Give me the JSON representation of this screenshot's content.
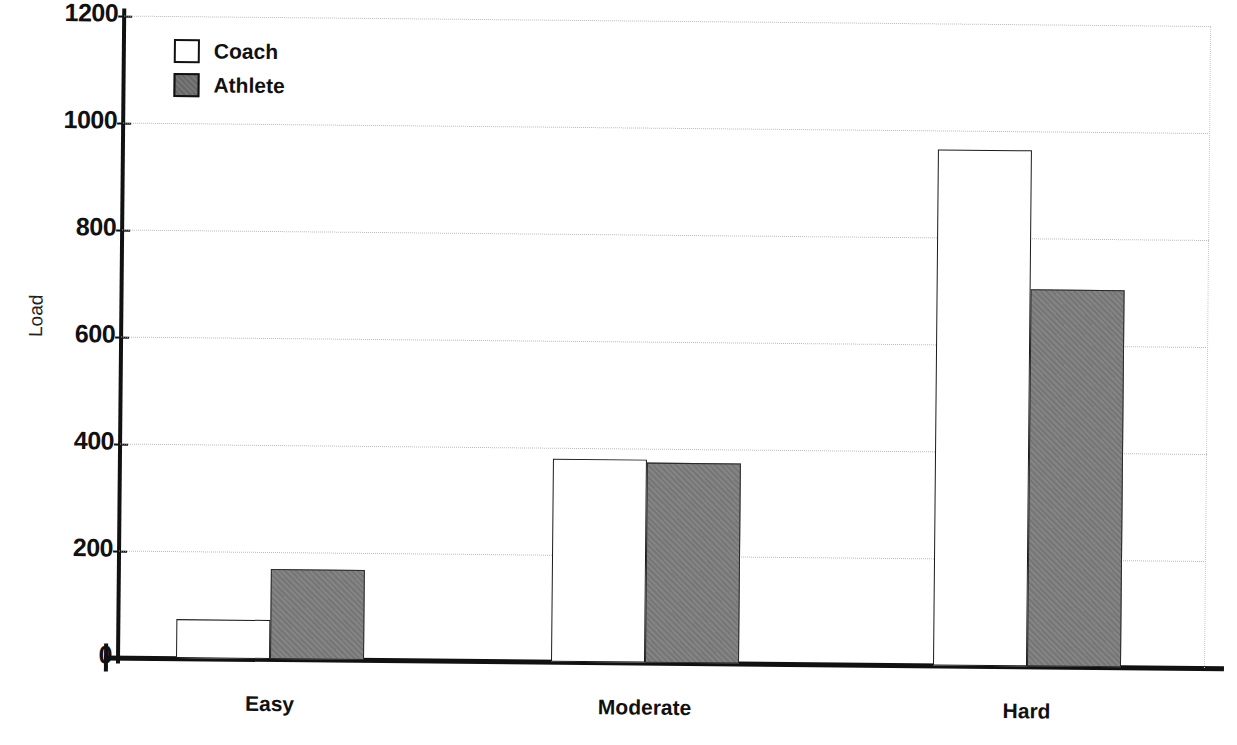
{
  "chart_data": {
    "type": "bar",
    "title": "",
    "xlabel": "",
    "ylabel": "Load",
    "categories": [
      "Easy",
      "Moderate",
      "Hard"
    ],
    "series": [
      {
        "name": "Coach",
        "values": [
          72,
          380,
          965
        ],
        "color": "#ffffff"
      },
      {
        "name": "Athlete",
        "values": [
          168,
          373,
          705
        ],
        "color": "#7d7d7d"
      }
    ],
    "ylim": [
      0,
      1200
    ],
    "yticks": [
      0,
      200,
      400,
      600,
      800,
      1000,
      1200
    ],
    "ytick_labels": [
      "0",
      "200",
      "400",
      "600",
      "800",
      "1000",
      "1200"
    ],
    "grid": true,
    "grid_axis": "y",
    "legend_position": "top-left"
  },
  "legend": {
    "items": [
      {
        "label": "Coach"
      },
      {
        "label": "Athlete"
      }
    ]
  },
  "axis": {
    "y_title": "Load"
  }
}
